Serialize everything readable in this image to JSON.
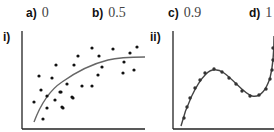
{
  "options": [
    {
      "letter": "a)",
      "value": "0"
    },
    {
      "letter": "b)",
      "value": "0.5"
    },
    {
      "letter": "c)",
      "value": "0.9"
    },
    {
      "letter": "d)",
      "value": "1"
    }
  ],
  "panels": [
    {
      "label": "i)",
      "description": "scatter plot with best-fit curve, loose fit"
    },
    {
      "label": "ii)",
      "description": "points lying exactly on a cubic curve"
    }
  ],
  "chart_data": [
    {
      "type": "scatter",
      "title": "i)",
      "xlabel": "",
      "ylabel": "",
      "grid": false,
      "points_px": [
        [
          78,
          56
        ],
        [
          56,
          65
        ],
        [
          74,
          65
        ],
        [
          39,
          76
        ],
        [
          52,
          78
        ],
        [
          67,
          84
        ],
        [
          92,
          48
        ],
        [
          113,
          49
        ],
        [
          137,
          47
        ],
        [
          99,
          56
        ],
        [
          130,
          53
        ],
        [
          102,
          67
        ],
        [
          124,
          62
        ],
        [
          98,
          75
        ],
        [
          123,
          73
        ],
        [
          134,
          70
        ],
        [
          82,
          86
        ],
        [
          92,
          86
        ],
        [
          61,
          92
        ],
        [
          72,
          97
        ],
        [
          62,
          107
        ],
        [
          41,
          90
        ],
        [
          60,
          92
        ],
        [
          73,
          98
        ],
        [
          34,
          102
        ],
        [
          47,
          96
        ],
        [
          55,
          100
        ],
        [
          47,
          108
        ],
        [
          63,
          108
        ],
        [
          43,
          119
        ]
      ],
      "fit_curve_px": [
        [
          34,
          122
        ],
        [
          45,
          100
        ],
        [
          60,
          83
        ],
        [
          80,
          70
        ],
        [
          100,
          62
        ],
        [
          120,
          58
        ],
        [
          145,
          57
        ]
      ]
    },
    {
      "type": "line",
      "title": "ii)",
      "xlabel": "",
      "ylabel": "",
      "grid": false,
      "points_px": [
        [
          184,
          118
        ],
        [
          187,
          107
        ],
        [
          190,
          98
        ],
        [
          195,
          88
        ],
        [
          200,
          80
        ],
        [
          205,
          73
        ],
        [
          214,
          69
        ],
        [
          222,
          72
        ],
        [
          229,
          78
        ],
        [
          236,
          84
        ],
        [
          242,
          91
        ],
        [
          250,
          96
        ],
        [
          259,
          95
        ],
        [
          266,
          89
        ],
        [
          270,
          79
        ],
        [
          272,
          70
        ],
        [
          273,
          60
        ],
        [
          273,
          48
        ]
      ]
    }
  ]
}
